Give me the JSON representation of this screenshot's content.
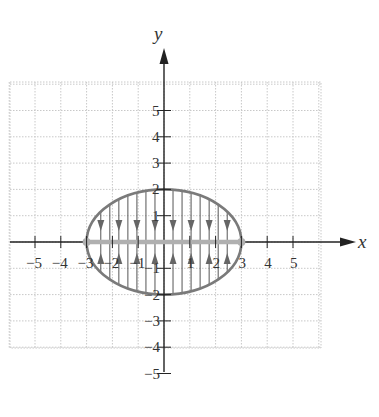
{
  "chart_data": {
    "type": "diagram",
    "title": "",
    "xlabel": "x",
    "ylabel": "y",
    "x_ticks": [
      -5,
      -4,
      -3,
      -2,
      -1,
      1,
      2,
      3,
      4,
      5
    ],
    "y_ticks": [
      -5,
      -4,
      -3,
      -2,
      -1,
      1,
      2,
      3,
      4,
      5
    ],
    "x_tick_labels": [
      "−5",
      "−4",
      "−3",
      "−2",
      "−1",
      "1",
      "2",
      "3",
      "4",
      "5"
    ],
    "y_tick_labels": [
      "−5",
      "−4",
      "−3",
      "−2",
      "−1",
      "1",
      "2",
      "3",
      "4",
      "5"
    ],
    "grid": true,
    "xlim": [
      -6,
      6
    ],
    "ylim": [
      -6,
      6
    ],
    "ellipse": {
      "cx": 0,
      "cy": 0,
      "a": 3,
      "b": 2,
      "equation": "x^2/9 + y^2/4 = 1"
    },
    "segment": {
      "from": [
        -3,
        0
      ],
      "to": [
        3,
        0
      ],
      "endpoints": "filled",
      "description": "line segment on x-axis from -3 to 3 (ellipse collapses onto this segment)"
    },
    "vertical_chords": [
      -2.45,
      -2.1,
      -1.75,
      -1.4,
      -1.05,
      -0.7,
      -0.35,
      0.35,
      0.7,
      1.05,
      1.4,
      1.75,
      2.1,
      2.45
    ],
    "arrow_x_positions": [
      -2.45,
      -1.75,
      -1.05,
      -0.35,
      0.35,
      1.05,
      1.75,
      2.45
    ],
    "arrow_direction": "toward x-axis (down from above, up from below)"
  },
  "colors": {
    "axis": "#222222",
    "ellipse": "#7a7a7a",
    "segment": "#b0b0b0",
    "grid": "#c8c8c8",
    "chord": "#555555"
  },
  "labels": {
    "x_axis": "x",
    "y_axis": "y"
  }
}
